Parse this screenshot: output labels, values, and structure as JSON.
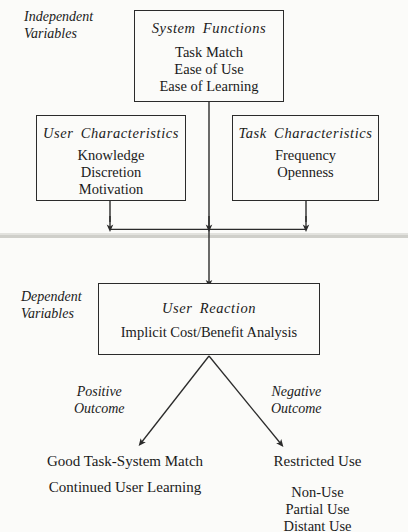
{
  "diagram": {
    "sections": {
      "independent": {
        "label_line1": "Independent",
        "label_line2": "Variables"
      },
      "dependent": {
        "label_line1": "Dependent",
        "label_line2": "Variables"
      }
    },
    "boxes": [
      {
        "id": "system-functions",
        "title": "System Functions",
        "items": [
          "Task Match",
          "Ease of Use",
          "Ease of Learning"
        ]
      },
      {
        "id": "user-characteristics",
        "title": "User Characteristics",
        "items": [
          "Knowledge",
          "Discretion",
          "Motivation"
        ]
      },
      {
        "id": "task-characteristics",
        "title": "Task Characteristics",
        "items": [
          "Frequency",
          "Openness"
        ]
      },
      {
        "id": "user-reaction",
        "title": "User Reaction",
        "items": [
          "Implicit Cost/Benefit Analysis"
        ]
      }
    ],
    "outcomes": {
      "positive": {
        "label_line1": "Positive",
        "label_line2": "Outcome",
        "result_1": "Good Task-System Match",
        "result_2": "Continued User Learning"
      },
      "negative": {
        "label_line1": "Negative",
        "label_line2": "Outcome",
        "result_1": "Restricted Use",
        "list": [
          "Non-Use",
          "Partial Use",
          "Distant Use"
        ]
      }
    },
    "colors": {
      "background": "#fbfbf9",
      "stroke": "#2b2b2b",
      "divider": "#cfcfca",
      "text": "#1a1a1a"
    }
  }
}
